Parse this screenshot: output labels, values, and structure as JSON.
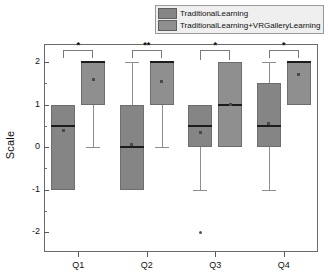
{
  "legend": {
    "items": [
      {
        "label": "TraditionalLearning",
        "color": "#858585"
      },
      {
        "label": "TraditionalLearning+VRGalleryLearning",
        "color": "#8f8f8f"
      }
    ]
  },
  "axes": {
    "ylabel": "Scale",
    "yticks": [
      "2",
      "1",
      "0",
      "-1",
      "-2"
    ],
    "ytick_values": [
      2,
      1,
      0,
      -1,
      -2
    ],
    "ylim": [
      -2.35,
      2.35
    ],
    "xticks": [
      "Q1",
      "Q2",
      "Q3",
      "Q4"
    ]
  },
  "chart_data": {
    "type": "box",
    "title": "",
    "xlabel": "",
    "ylabel": "Scale",
    "ylim": [
      -2.35,
      2.35
    ],
    "grid": false,
    "legend_position": "top-right",
    "categories": [
      "Q1",
      "Q2",
      "Q3",
      "Q4"
    ],
    "series": [
      {
        "name": "TraditionalLearning",
        "color": "#858585",
        "boxes": [
          {
            "category": "Q1",
            "q1": -1.0,
            "median": 0.5,
            "q3": 1.0,
            "whisker_low": -1.0,
            "whisker_high": 1.0,
            "mean": 0.4,
            "outliers": []
          },
          {
            "category": "Q2",
            "q1": -1.0,
            "median": 0.0,
            "q3": 1.0,
            "whisker_low": -1.0,
            "whisker_high": 2.0,
            "mean": 0.05,
            "outliers": []
          },
          {
            "category": "Q3",
            "q1": 0.0,
            "median": 0.5,
            "q3": 1.0,
            "whisker_low": -1.0,
            "whisker_high": 1.0,
            "mean": 0.35,
            "outliers": [
              -2.0
            ]
          },
          {
            "category": "Q4",
            "q1": 0.0,
            "median": 0.5,
            "q3": 1.5,
            "whisker_low": -1.0,
            "whisker_high": 2.0,
            "mean": 0.55,
            "outliers": []
          }
        ]
      },
      {
        "name": "TraditionalLearning+VRGalleryLearning",
        "color": "#8f8f8f",
        "boxes": [
          {
            "category": "Q1",
            "q1": 1.0,
            "median": 2.0,
            "q3": 2.0,
            "whisker_low": 0.0,
            "whisker_high": 2.0,
            "mean": 1.6,
            "outliers": []
          },
          {
            "category": "Q2",
            "q1": 1.0,
            "median": 2.0,
            "q3": 2.0,
            "whisker_low": 0.0,
            "whisker_high": 2.0,
            "mean": 1.55,
            "outliers": []
          },
          {
            "category": "Q3",
            "q1": 0.0,
            "median": 1.0,
            "q3": 2.0,
            "whisker_low": 0.0,
            "whisker_high": 2.0,
            "mean": 1.0,
            "outliers": []
          },
          {
            "category": "Q4",
            "q1": 1.0,
            "median": 2.0,
            "q3": 2.0,
            "whisker_low": 1.0,
            "whisker_high": 2.0,
            "mean": 1.7,
            "outliers": []
          }
        ]
      }
    ],
    "annotations": [
      {
        "category": "Q1",
        "label": "*",
        "significance": "p<0.05"
      },
      {
        "category": "Q2",
        "label": "**",
        "significance": "p<0.01"
      },
      {
        "category": "Q3",
        "label": "*",
        "significance": "p<0.05"
      },
      {
        "category": "Q4",
        "label": "*",
        "significance": "p<0.05"
      }
    ]
  }
}
